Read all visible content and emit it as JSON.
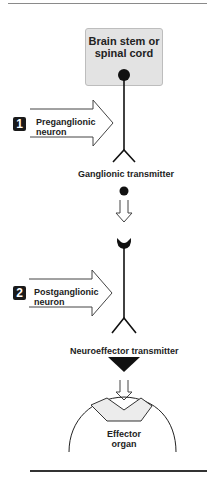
{
  "diagram": {
    "cns_box": {
      "label_line1": "Brain stem or",
      "label_line2": "spinal cord"
    },
    "steps": [
      {
        "number": "1",
        "label_line1": "Preganglionic",
        "label_line2": "neuron"
      },
      {
        "number": "2",
        "label_line1": "Postganglionic",
        "label_line2": "neuron"
      }
    ],
    "transmitters": {
      "ganglionic": "Ganglionic transmitter",
      "neuroeffector": "Neuroeffector transmitter"
    },
    "effector": {
      "label_line1": "Effector",
      "label_line2": "organ"
    },
    "colors": {
      "box_fill": "#e3e3e3",
      "receptor_fill": "#ececec",
      "ink": "#111111"
    }
  }
}
